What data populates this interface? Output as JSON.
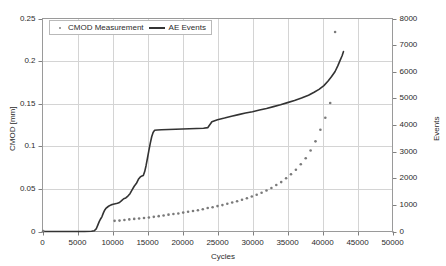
{
  "chart_data": {
    "type": "scatter",
    "title": "",
    "xlabel": "Cycles",
    "ylabel": "CMOD [mm]",
    "y2label": "Events",
    "xlim": [
      0,
      50000
    ],
    "ylim": [
      0,
      0.25
    ],
    "y2lim": [
      0,
      8000
    ],
    "grid": true,
    "legend_position": "top-left-inside",
    "xticks": [
      0,
      5000,
      10000,
      15000,
      20000,
      25000,
      30000,
      35000,
      40000,
      45000,
      50000
    ],
    "yticks": [
      0,
      0.05,
      0.1,
      0.15,
      0.2,
      0.25
    ],
    "y2ticks": [
      0,
      1000,
      2000,
      3000,
      4000,
      5000,
      6000,
      7000,
      8000
    ],
    "xtick_labels": [
      "0",
      "5000",
      "10000",
      "15000",
      "20000",
      "25000",
      "30000",
      "35000",
      "40000",
      "45000",
      "50000"
    ],
    "ytick_labels": [
      "0",
      "0.05",
      "0.1",
      "0.15",
      "0.2",
      "0.25"
    ],
    "y2tick_labels": [
      "0",
      "1000",
      "2000",
      "3000",
      "4000",
      "5000",
      "6000",
      "7000",
      "8000"
    ],
    "series": [
      {
        "name": "CMOD Measurement",
        "type": "scatter",
        "axis": "left",
        "color": "#7a7a7a",
        "marker": "dot",
        "x": [
          100,
          10300,
          11000,
          11700,
          12400,
          13100,
          13800,
          14500,
          15200,
          15900,
          16600,
          17300,
          18000,
          18700,
          19400,
          20100,
          20800,
          21500,
          22200,
          22900,
          23600,
          24300,
          25000,
          25700,
          26400,
          27100,
          27800,
          28500,
          29200,
          29900,
          30600,
          31300,
          32000,
          32700,
          33400,
          34100,
          34800,
          35500,
          36200,
          36900,
          37600,
          38300,
          39000,
          39700,
          40400,
          41100,
          41800
        ],
        "y": [
          0.0005,
          0.0125,
          0.0128,
          0.0135,
          0.0142,
          0.0148,
          0.0152,
          0.0158,
          0.0165,
          0.0172,
          0.018,
          0.0188,
          0.0198,
          0.0205,
          0.0212,
          0.0222,
          0.0232,
          0.024,
          0.025,
          0.0262,
          0.0275,
          0.0285,
          0.0298,
          0.031,
          0.0325,
          0.034,
          0.0355,
          0.0372,
          0.039,
          0.041,
          0.0432,
          0.0455,
          0.0482,
          0.051,
          0.0545,
          0.058,
          0.0625,
          0.0672,
          0.0725,
          0.079,
          0.086,
          0.095,
          0.1058,
          0.1195,
          0.1335,
          0.1508,
          0.2342
        ]
      },
      {
        "name": "AE Events",
        "type": "line",
        "axis": "right",
        "color": "#333333",
        "x": [
          0,
          3400,
          5000,
          6000,
          7000,
          7400,
          7700,
          7900,
          8100,
          8300,
          8500,
          8700,
          8900,
          9100,
          9300,
          9500,
          9800,
          10100,
          10400,
          10700,
          11000,
          11300,
          11600,
          11900,
          12200,
          12500,
          12800,
          13100,
          13400,
          13700,
          14000,
          14200,
          14400,
          14600,
          14800,
          15000,
          15200,
          15400,
          15600,
          15800,
          16000,
          16400,
          17000,
          18000,
          19000,
          20000,
          21000,
          22000,
          23000,
          23600,
          24200,
          25000,
          26000,
          27000,
          28000,
          29000,
          30000,
          31000,
          32000,
          33000,
          34000,
          35000,
          36000,
          37000,
          38000,
          38800,
          39500,
          40200,
          40800,
          41300,
          41800,
          42200,
          42500,
          42800,
          43000
        ],
        "y": [
          0,
          0,
          0,
          0,
          10,
          30,
          110,
          240,
          370,
          470,
          560,
          700,
          810,
          880,
          920,
          960,
          1000,
          1020,
          1040,
          1060,
          1090,
          1160,
          1230,
          1260,
          1330,
          1420,
          1560,
          1700,
          1800,
          1960,
          2060,
          2080,
          2100,
          2250,
          2480,
          2760,
          3050,
          3320,
          3560,
          3720,
          3800,
          3810,
          3820,
          3830,
          3840,
          3850,
          3860,
          3870,
          3880,
          3900,
          4120,
          4200,
          4260,
          4330,
          4390,
          4450,
          4500,
          4560,
          4620,
          4690,
          4760,
          4840,
          4920,
          5010,
          5120,
          5230,
          5340,
          5480,
          5650,
          5820,
          6010,
          6230,
          6420,
          6600,
          6760
        ]
      }
    ]
  },
  "legend": {
    "entries": [
      {
        "label": "CMOD Measurement",
        "marker": "dot-marker-icon"
      },
      {
        "label": "AE Events",
        "marker": "line-marker-icon"
      }
    ]
  },
  "colors": {
    "scatter": "#7a7a7a",
    "line": "#333333",
    "grid": "#d4d4d4",
    "axis": "#808080",
    "text": "#2b2b2b",
    "background": "#ffffff"
  }
}
